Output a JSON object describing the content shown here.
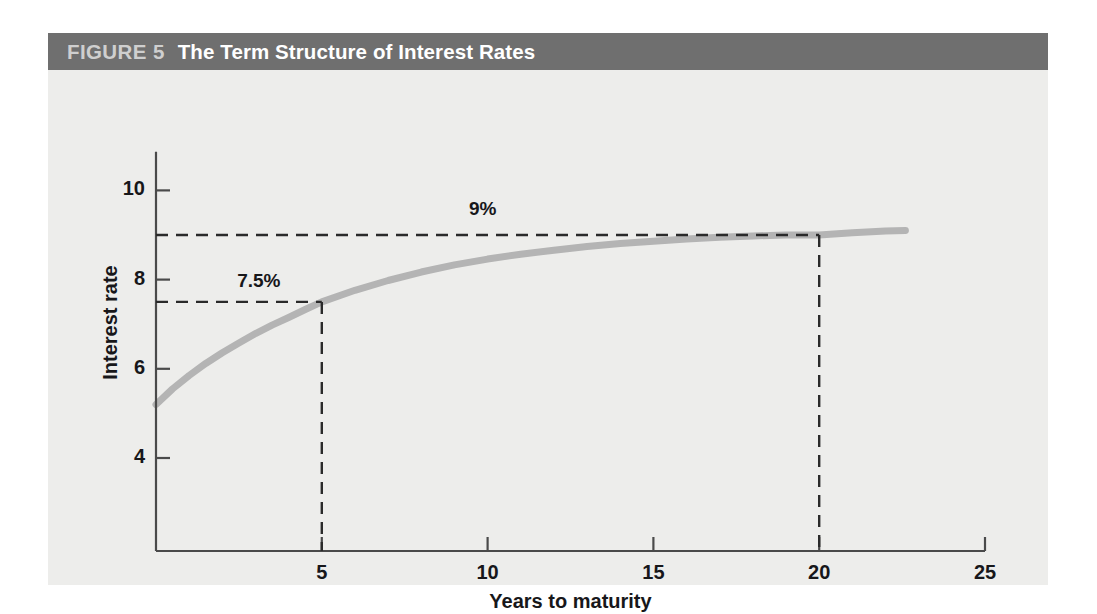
{
  "figure": {
    "number_label": "FIGURE 5",
    "title": "The Term Structure of Interest Rates",
    "title_bar_color": "#6f6f6f",
    "number_color": "#cfcfcf",
    "title_color": "#ffffff",
    "panel_background": "#ededeb"
  },
  "chart_data": {
    "type": "line",
    "title": "The Term Structure of Interest Rates",
    "xlabel": "Years to maturity",
    "ylabel": "Interest rate",
    "xlim": [
      0,
      25
    ],
    "ylim": [
      3.0,
      11.0
    ],
    "xticks": [
      5,
      10,
      15,
      20,
      25
    ],
    "xtick_labels": [
      "5",
      "10",
      "15",
      "20",
      "25"
    ],
    "yticks": [
      4,
      6,
      8,
      10
    ],
    "ytick_labels": [
      "4",
      "6",
      "8",
      "10"
    ],
    "grid": false,
    "legend": null,
    "series": [
      {
        "name": "Yield curve",
        "color": "#b4b4b4",
        "line_width": 7,
        "x": [
          0.0,
          0.5,
          1.0,
          1.5,
          2.0,
          2.5,
          3.0,
          3.5,
          4.0,
          4.5,
          5.0,
          6.0,
          7.0,
          8.0,
          9.0,
          10.0,
          11.0,
          12.0,
          13.0,
          14.0,
          15.0,
          16.0,
          17.0,
          18.0,
          19.0,
          20.0,
          21.0,
          22.0,
          22.6
        ],
        "y": [
          5.2,
          5.55,
          5.85,
          6.12,
          6.36,
          6.58,
          6.79,
          6.98,
          7.15,
          7.33,
          7.5,
          7.76,
          7.98,
          8.17,
          8.33,
          8.46,
          8.57,
          8.66,
          8.74,
          8.81,
          8.86,
          8.91,
          8.95,
          8.98,
          9.0,
          9.0,
          9.05,
          9.09,
          9.1
        ]
      }
    ],
    "annotations": [
      {
        "label": "7.5%",
        "x": 5,
        "y": 7.5,
        "line_style": "dashed",
        "color": "#2a2a2a",
        "label_x": 3.1,
        "label_y": 7.95
      },
      {
        "label": "9%",
        "x": 20,
        "y": 9.0,
        "line_style": "dashed",
        "color": "#2a2a2a",
        "label_x": 9.85,
        "label_y": 9.55
      }
    ],
    "axis_color": "#4a4a4a"
  }
}
